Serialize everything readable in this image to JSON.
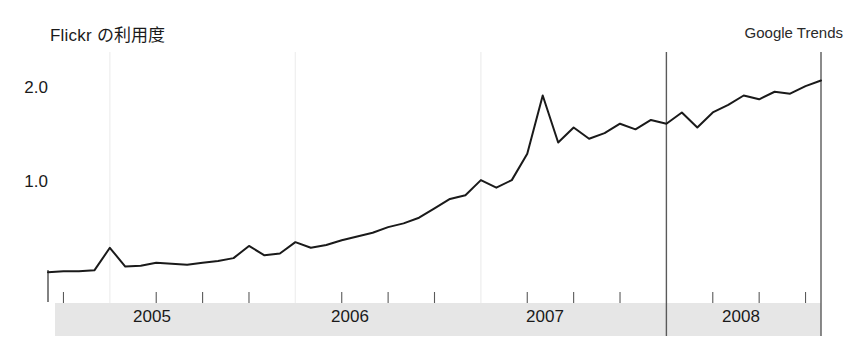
{
  "chart_title": "Flickr の利用度",
  "brand_label": "Google Trends",
  "chart_data": {
    "type": "line",
    "title": "Flickr の利用度",
    "subtitle": "Google Trends",
    "xlabel": "",
    "ylabel": "",
    "grid": "vertical-year-boundaries",
    "legend": "none",
    "ylim": [
      0,
      2.35
    ],
    "yticks": [
      1.0,
      2.0
    ],
    "ytick_labels": [
      "1.0",
      "2.0"
    ],
    "xlim": [
      "2004-09",
      "2008-11"
    ],
    "xtick_labels": [
      "2005",
      "2006",
      "2007",
      "2008"
    ],
    "xtick_minor": "quarterly",
    "series": [
      {
        "name": "Flickr",
        "color": "#1a1a1a",
        "x": [
          "2004-09",
          "2004-10",
          "2004-11",
          "2004-12",
          "2005-01",
          "2005-02",
          "2005-03",
          "2005-04",
          "2005-05",
          "2005-06",
          "2005-07",
          "2005-08",
          "2005-09",
          "2005-10",
          "2005-11",
          "2005-12",
          "2006-01",
          "2006-02",
          "2006-03",
          "2006-04",
          "2006-05",
          "2006-06",
          "2006-07",
          "2006-08",
          "2006-09",
          "2006-10",
          "2006-11",
          "2006-12",
          "2007-01",
          "2007-02",
          "2007-03",
          "2007-04",
          "2007-05",
          "2007-06",
          "2007-07",
          "2007-08",
          "2007-09",
          "2007-10",
          "2007-11",
          "2007-12",
          "2008-01",
          "2008-02",
          "2008-03",
          "2008-04",
          "2008-05",
          "2008-06",
          "2008-07",
          "2008-08",
          "2008-09",
          "2008-10",
          "2008-11"
        ],
        "values": [
          0.04,
          0.05,
          0.05,
          0.06,
          0.3,
          0.1,
          0.11,
          0.14,
          0.13,
          0.12,
          0.14,
          0.16,
          0.19,
          0.32,
          0.22,
          0.24,
          0.36,
          0.3,
          0.33,
          0.38,
          0.42,
          0.46,
          0.52,
          0.56,
          0.62,
          0.72,
          0.82,
          0.86,
          1.02,
          0.94,
          1.02,
          1.3,
          1.92,
          1.42,
          1.58,
          1.46,
          1.52,
          1.62,
          1.56,
          1.66,
          1.62,
          1.74,
          1.58,
          1.74,
          1.82,
          1.92,
          1.88,
          1.96,
          1.94,
          2.02,
          2.08
        ]
      }
    ]
  },
  "y_ticks": [
    {
      "label": "2.0",
      "top": 78
    },
    {
      "label": "1.0",
      "top": 172
    }
  ],
  "x_ticks": [
    {
      "label": "2005",
      "left": 107
    },
    {
      "label": "2006",
      "left": 305
    },
    {
      "label": "2007",
      "left": 500
    },
    {
      "label": "2008",
      "left": 696
    }
  ],
  "colors": {
    "line": "#1a1a1a",
    "band": "#e6e6e6",
    "axis": "#4d4d4d",
    "gridline": "#f0f0f0",
    "text": "#1a1a1a",
    "background": "#ffffff"
  }
}
